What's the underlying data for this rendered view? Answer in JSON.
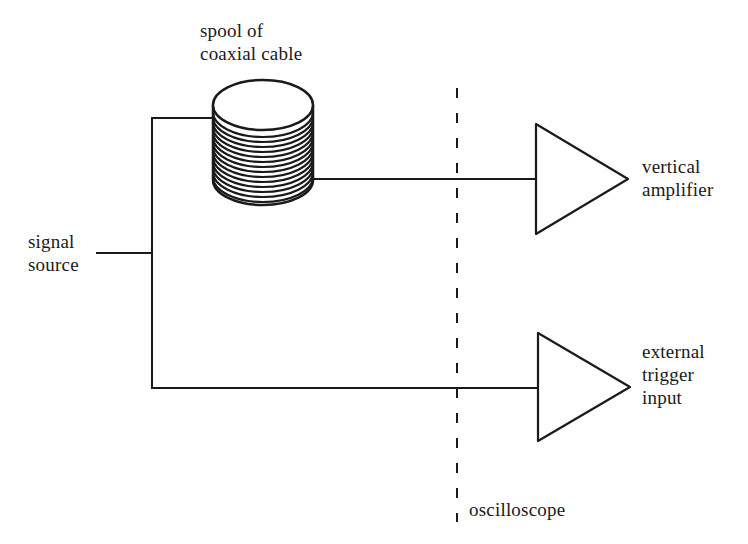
{
  "diagram": {
    "colors": {
      "stroke": "#1a1a1a",
      "background": "#ffffff"
    },
    "nodes": {
      "signal_source": {
        "lines": [
          "signal",
          "source"
        ]
      },
      "spool": {
        "lines": [
          "spool of",
          "coaxial cable"
        ],
        "icon": "cable-spool-icon"
      },
      "vertical_amplifier": {
        "lines": [
          "vertical",
          "amplifier"
        ],
        "icon": "amplifier-triangle-icon"
      },
      "external_trigger": {
        "lines": [
          "external",
          "trigger",
          "input"
        ],
        "icon": "amplifier-triangle-icon"
      },
      "oscilloscope": {
        "label": "oscilloscope",
        "boundary": "dashed-vertical-line"
      }
    },
    "edges": [
      {
        "from": "signal_source",
        "to": "spool"
      },
      {
        "from": "spool",
        "to": "vertical_amplifier"
      },
      {
        "from": "signal_source",
        "to": "external_trigger"
      }
    ]
  }
}
